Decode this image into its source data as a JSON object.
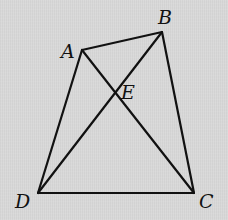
{
  "figure": {
    "type": "quadrilateral with diagonals",
    "points": {
      "A": {
        "label": "A"
      },
      "B": {
        "label": "B"
      },
      "C": {
        "label": "C"
      },
      "D": {
        "label": "D"
      },
      "E": {
        "label": "E"
      }
    },
    "segments": [
      {
        "id": "AB",
        "from": "A",
        "to": "B"
      },
      {
        "id": "BC",
        "from": "B",
        "to": "C"
      },
      {
        "id": "CD",
        "from": "C",
        "to": "D"
      },
      {
        "id": "DA",
        "from": "D",
        "to": "A"
      },
      {
        "id": "AC",
        "from": "A",
        "to": "C"
      },
      {
        "id": "BD",
        "from": "B",
        "to": "D"
      }
    ],
    "intersection": {
      "point": "E",
      "of": [
        "AC",
        "BD"
      ]
    },
    "colors": {
      "line": "#111111",
      "background": "#d9d9d9"
    }
  }
}
